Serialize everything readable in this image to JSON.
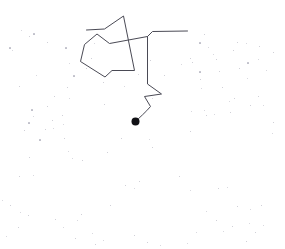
{
  "canvas": {
    "width": 285,
    "height": 249,
    "background_color": "#ffffff",
    "title": "mouse-trajectory-trace"
  },
  "trajectory": {
    "name": "pointer-path",
    "stroke_color": "#4a4a55",
    "stroke_width": 1,
    "fill": "none",
    "path": "M 135.5 121.5 C 139 118 146 112 150.5 106.5 L 144.5 96.5 L 161.5 94.0 L 147.5 84.0 L 147.5 36.5 L 152.5 31.5 L 187.5 31.0 M 147.5 36.5 L 109.5 43.5 L 97.0 34.0 L 84.5 44.5 L 80.5 61.5 L 105.0 77.0 L 112.0 70.5 L 134.5 70.5 L 123.5 16.0 L 104.5 29.0 L 86.5 30.0",
    "segments": [
      {
        "name": "curve-from-endpoint",
        "from": [
          135.5,
          121.5
        ],
        "to": [
          150.5,
          106.5
        ]
      },
      {
        "name": "zig-lower-left",
        "from": [
          150.5,
          106.5
        ],
        "to": [
          144.5,
          96.5
        ]
      },
      {
        "name": "zig-lower-right",
        "from": [
          144.5,
          96.5
        ],
        "to": [
          161.5,
          94.0
        ]
      },
      {
        "name": "zig-lower-back",
        "from": [
          161.5,
          94.0
        ],
        "to": [
          147.5,
          84.0
        ]
      },
      {
        "name": "vertical-riser",
        "from": [
          147.5,
          84.0
        ],
        "to": [
          147.5,
          36.5
        ]
      },
      {
        "name": "corner-to-horizontal",
        "from": [
          147.5,
          36.5
        ],
        "to": [
          152.5,
          31.5
        ]
      },
      {
        "name": "horizontal-right-tail",
        "from": [
          152.5,
          31.5
        ],
        "to": [
          187.5,
          31.0
        ]
      },
      {
        "name": "diagonal-to-polygon",
        "from": [
          147.5,
          36.5
        ],
        "to": [
          109.5,
          43.5
        ]
      },
      {
        "name": "polygon-notch-up",
        "from": [
          109.5,
          43.5
        ],
        "to": [
          97.0,
          34.0
        ]
      },
      {
        "name": "polygon-notch-down",
        "from": [
          97.0,
          34.0
        ],
        "to": [
          84.5,
          44.5
        ]
      },
      {
        "name": "polygon-left-edge",
        "from": [
          84.5,
          44.5
        ],
        "to": [
          80.5,
          61.5
        ]
      },
      {
        "name": "polygon-bottom-left",
        "from": [
          80.5,
          61.5
        ],
        "to": [
          105.0,
          77.0
        ]
      },
      {
        "name": "polygon-bottom-notch",
        "from": [
          105.0,
          77.0
        ],
        "to": [
          112.0,
          70.5
        ]
      },
      {
        "name": "polygon-bottom-right",
        "from": [
          112.0,
          70.5
        ],
        "to": [
          134.5,
          70.5
        ]
      },
      {
        "name": "long-diagonal-to-apex",
        "from": [
          134.5,
          70.5
        ],
        "to": [
          123.5,
          16.0
        ]
      },
      {
        "name": "apex-down-left",
        "from": [
          123.5,
          16.0
        ],
        "to": [
          104.5,
          29.0
        ]
      },
      {
        "name": "top-left-tail",
        "from": [
          104.5,
          29.0
        ],
        "to": [
          86.5,
          30.0
        ]
      }
    ]
  },
  "endpoint_marker": {
    "name": "path-endpoint-dot",
    "cx": 135.5,
    "cy": 121.5,
    "r": 4.0,
    "color": "#111115"
  },
  "specks": {
    "name": "background-noise-dots",
    "color": "#8d8d9e",
    "points": [
      [
        10,
        48,
        1.2
      ],
      [
        29,
        36,
        1.0
      ],
      [
        21,
        30,
        0.9
      ],
      [
        34,
        34,
        1.1
      ],
      [
        47,
        42,
        1.0
      ],
      [
        12,
        50,
        0.9
      ],
      [
        66,
        48,
        1.1
      ],
      [
        67,
        87,
        1.0
      ],
      [
        19,
        86,
        1.0
      ],
      [
        36,
        75,
        0.9
      ],
      [
        74,
        76,
        1.1
      ],
      [
        54,
        96,
        1.0
      ],
      [
        69,
        98,
        0.9
      ],
      [
        32,
        110,
        1.1
      ],
      [
        47,
        106,
        1.0
      ],
      [
        33,
        116,
        0.9
      ],
      [
        62,
        115,
        1.0
      ],
      [
        29,
        123,
        1.1
      ],
      [
        63,
        124,
        0.9
      ],
      [
        52,
        120,
        1.0
      ],
      [
        94,
        43,
        0.9
      ],
      [
        91,
        58,
        1.0
      ],
      [
        69,
        63,
        0.9
      ],
      [
        86,
        68,
        1.0
      ],
      [
        103,
        82,
        1.0
      ],
      [
        124,
        86,
        0.9
      ],
      [
        104,
        104,
        1.0
      ],
      [
        138,
        74,
        0.9
      ],
      [
        150,
        60,
        1.0
      ],
      [
        152,
        98,
        0.9
      ],
      [
        164,
        75,
        1.0
      ],
      [
        181,
        64,
        0.9
      ],
      [
        192,
        62,
        1.0
      ],
      [
        200,
        43,
        1.1
      ],
      [
        204,
        34,
        1.0
      ],
      [
        237,
        42,
        1.0
      ],
      [
        246,
        43,
        0.9
      ],
      [
        259,
        46,
        1.0
      ],
      [
        273,
        52,
        1.0
      ],
      [
        213,
        54,
        0.9
      ],
      [
        233,
        50,
        1.0
      ],
      [
        258,
        59,
        0.9
      ],
      [
        190,
        58,
        1.0
      ],
      [
        208,
        47,
        0.9
      ],
      [
        216,
        59,
        1.0
      ],
      [
        248,
        63,
        1.1
      ],
      [
        239,
        68,
        1.0
      ],
      [
        266,
        70,
        0.9
      ],
      [
        219,
        71,
        1.0
      ],
      [
        200,
        72,
        1.1
      ],
      [
        247,
        78,
        0.9
      ],
      [
        200,
        79,
        1.0
      ],
      [
        201,
        88,
        0.9
      ],
      [
        222,
        87,
        1.0
      ],
      [
        229,
        101,
        0.9
      ],
      [
        234,
        98,
        1.0
      ],
      [
        258,
        96,
        1.0
      ],
      [
        204,
        110,
        0.9
      ],
      [
        206,
        115,
        1.0
      ],
      [
        214,
        114,
        0.9
      ],
      [
        230,
        112,
        1.0
      ],
      [
        191,
        111,
        0.9
      ],
      [
        250,
        105,
        1.0
      ],
      [
        263,
        105,
        0.9
      ],
      [
        273,
        122,
        1.0
      ],
      [
        190,
        131,
        1.0
      ],
      [
        24,
        130,
        1.0
      ],
      [
        45,
        129,
        1.0
      ],
      [
        53,
        128,
        0.9
      ],
      [
        40,
        140,
        1.1
      ],
      [
        64,
        138,
        1.0
      ],
      [
        272,
        133,
        0.9
      ],
      [
        68,
        151,
        0.9
      ],
      [
        29,
        157,
        1.0
      ],
      [
        72,
        158,
        0.9
      ],
      [
        82,
        160,
        1.0
      ],
      [
        19,
        176,
        1.0
      ],
      [
        33,
        175,
        0.9
      ],
      [
        107,
        152,
        1.0
      ],
      [
        121,
        138,
        1.0
      ],
      [
        149,
        139,
        0.9
      ],
      [
        152,
        147,
        1.0
      ],
      [
        125,
        185,
        1.0
      ],
      [
        134,
        188,
        0.9
      ],
      [
        139,
        181,
        1.0
      ],
      [
        110,
        205,
        1.0
      ],
      [
        2,
        200,
        0.9
      ],
      [
        10,
        205,
        1.0
      ],
      [
        20,
        212,
        0.9
      ],
      [
        28,
        215,
        1.0
      ],
      [
        55,
        219,
        1.0
      ],
      [
        77,
        220,
        0.9
      ],
      [
        81,
        214,
        1.0
      ],
      [
        63,
        227,
        0.9
      ],
      [
        18,
        227,
        1.0
      ],
      [
        6,
        236,
        0.9
      ],
      [
        179,
        176,
        1.0
      ],
      [
        190,
        190,
        0.9
      ],
      [
        218,
        188,
        1.0
      ],
      [
        227,
        187,
        0.9
      ],
      [
        237,
        206,
        1.0
      ],
      [
        250,
        209,
        0.9
      ],
      [
        261,
        205,
        1.0
      ],
      [
        206,
        211,
        0.9
      ],
      [
        216,
        220,
        1.0
      ],
      [
        223,
        231,
        0.9
      ],
      [
        232,
        226,
        1.0
      ],
      [
        249,
        223,
        0.9
      ],
      [
        255,
        232,
        1.0
      ],
      [
        263,
        225,
        0.9
      ],
      [
        246,
        241,
        1.0
      ],
      [
        196,
        232,
        0.9
      ],
      [
        147,
        242,
        1.0
      ],
      [
        160,
        245,
        0.9
      ],
      [
        95,
        244,
        1.0
      ],
      [
        103,
        240,
        0.9
      ],
      [
        134,
        235,
        1.0
      ],
      [
        92,
        233,
        0.9
      ],
      [
        75,
        238,
        1.0
      ],
      [
        187,
        243,
        0.9
      ]
    ]
  }
}
